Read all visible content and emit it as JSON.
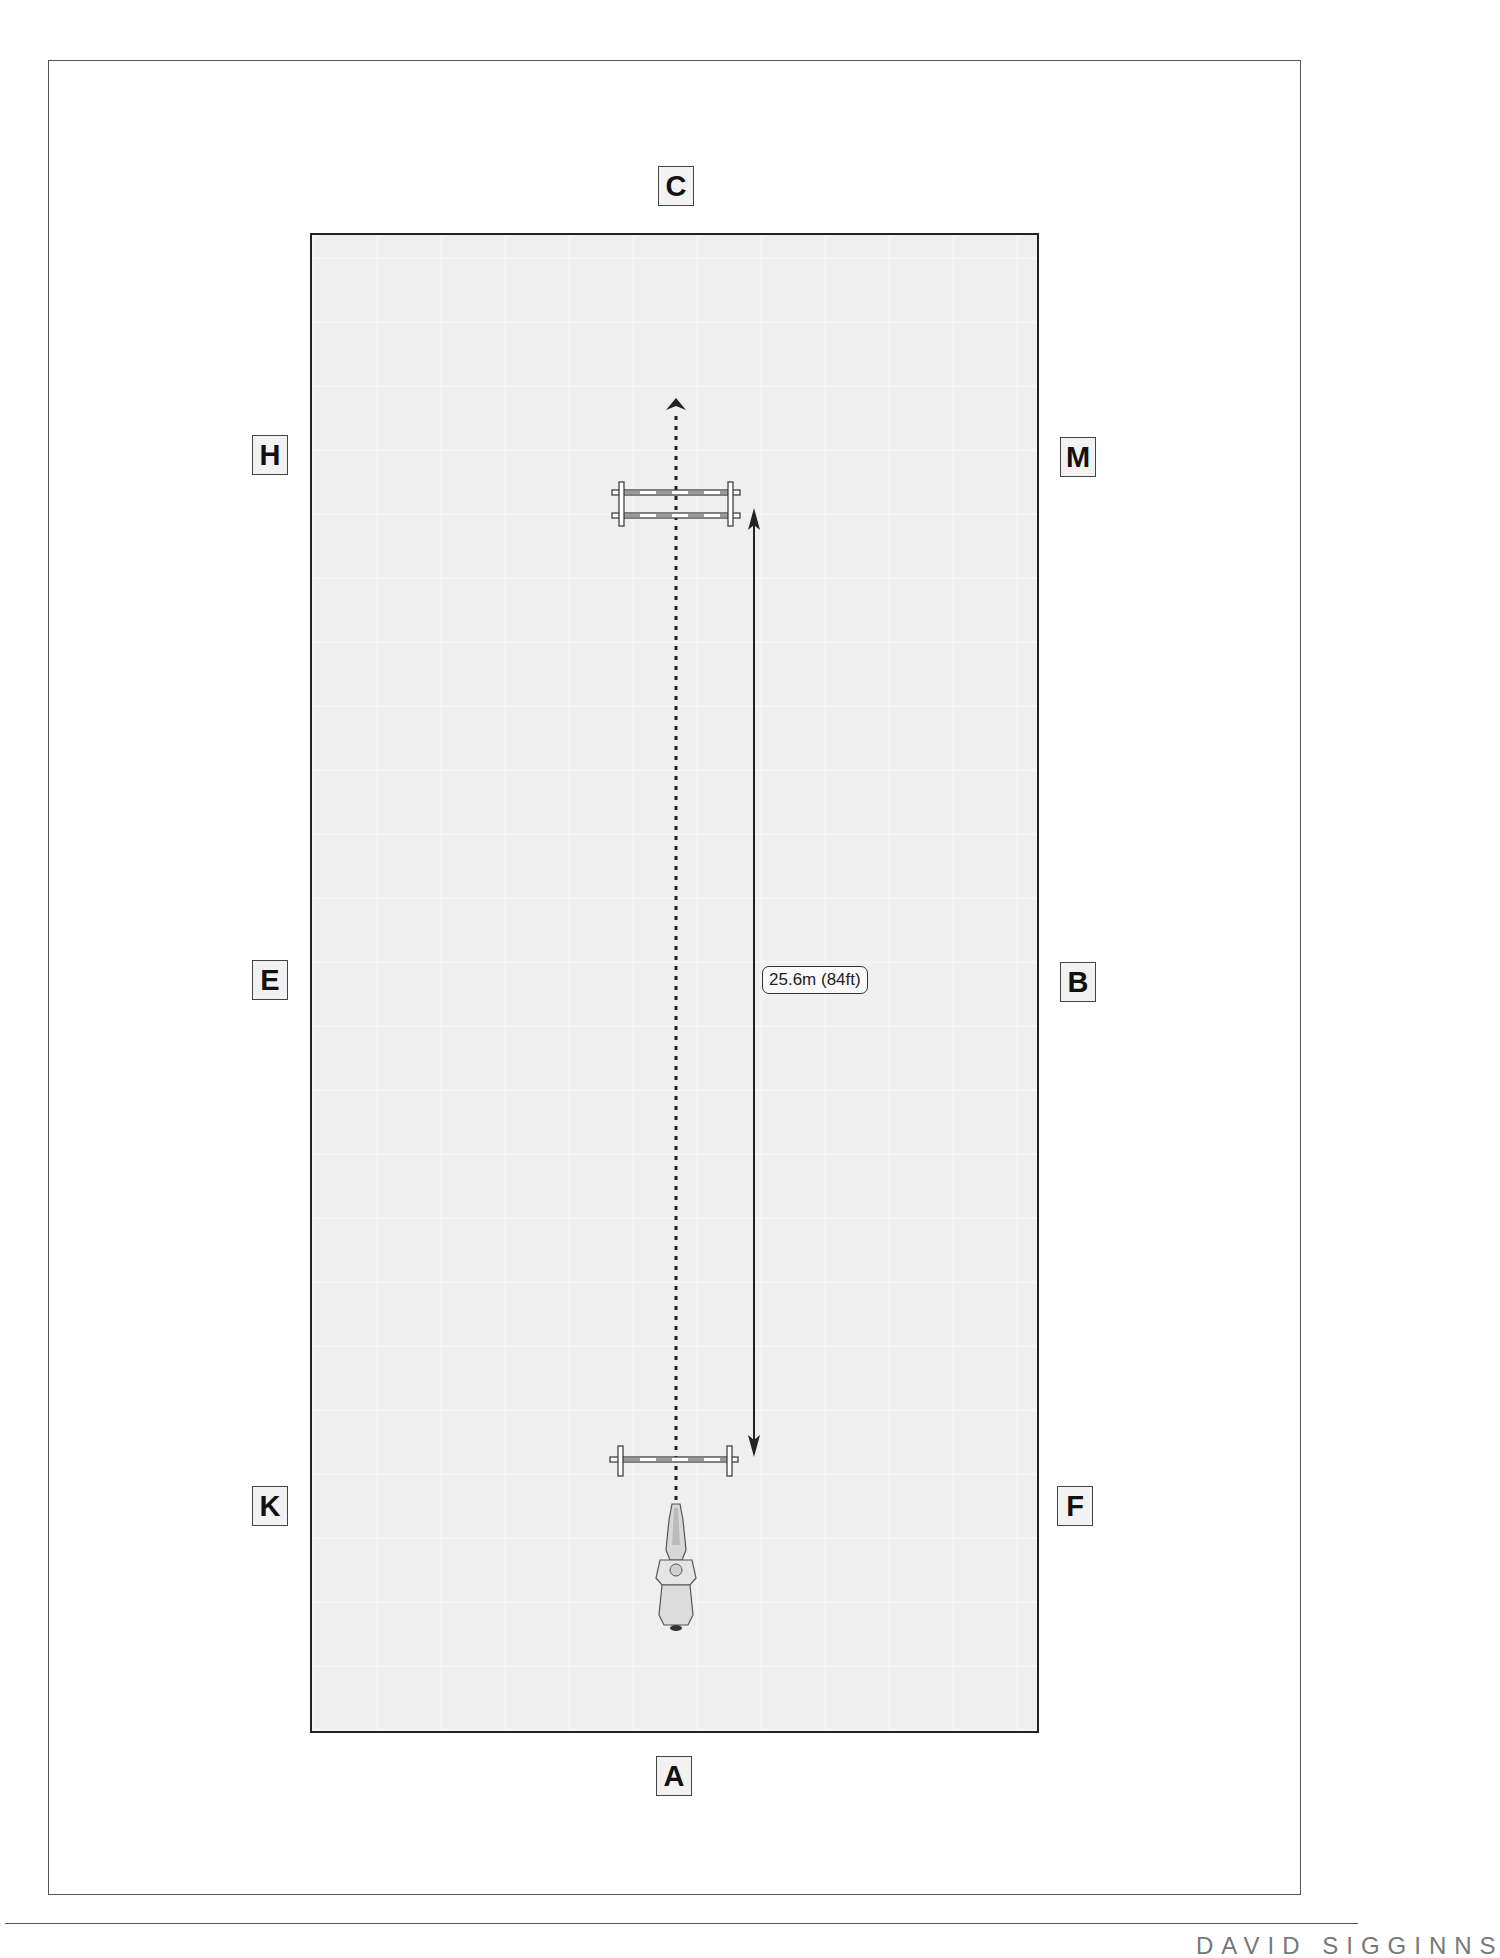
{
  "diagram": {
    "type": "dressage-arena-exercise",
    "arena_markers": {
      "top": "C",
      "top_left": "H",
      "top_right": "M",
      "middle_left": "E",
      "middle_right": "B",
      "bottom_left": "K",
      "bottom_right": "F",
      "bottom": "A"
    },
    "distance_label": "25.6m (84ft)",
    "elements": [
      {
        "name": "ground-pole-near-A",
        "kind": "single pole",
        "position": "between K and F line, center"
      },
      {
        "name": "oxer-near-C",
        "kind": "double pole (oxer)",
        "position": "between H and M line, center"
      },
      {
        "name": "horse-and-rider",
        "kind": "icon",
        "position": "near A, facing C"
      },
      {
        "name": "track-line",
        "kind": "dotted arrow",
        "from": "A",
        "to": "C"
      },
      {
        "name": "distance-arrow",
        "kind": "double-headed arrow",
        "value": "25.6m (84ft)"
      }
    ],
    "colors": {
      "arena_fill": "#efefef",
      "outline": "#222222",
      "marker_fill": "#f2f2f2"
    }
  },
  "footer": {
    "text": "DAVID SIGGINNS"
  }
}
